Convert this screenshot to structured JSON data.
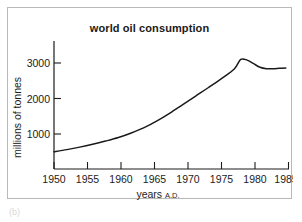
{
  "figure": {
    "caption_fragment": "(b)"
  },
  "chart_data": {
    "type": "line",
    "title": "world oil consumption",
    "xlabel": "years",
    "xlabel_suffix": "A.D.",
    "ylabel": "millions of tonnes",
    "xlim": [
      1950,
      1986.5
    ],
    "ylim": [
      0,
      3400
    ],
    "xticks": [
      1950,
      1955,
      1960,
      1965,
      1970,
      1975,
      1980,
      1985
    ],
    "xticklabels": [
      "1950",
      "1955",
      "1960",
      "1965",
      "1970",
      "1975",
      "1980",
      "1985"
    ],
    "yticks": [
      1000,
      2000,
      3000
    ],
    "yticklabels": [
      "1000",
      "2000",
      "3000"
    ],
    "grid": false,
    "legend": null,
    "line_color": "#1a1a1a",
    "series": [
      {
        "name": "world oil consumption",
        "x": [
          1950,
          1952,
          1954,
          1956,
          1958,
          1960,
          1962,
          1964,
          1966,
          1968,
          1970,
          1972,
          1974,
          1976,
          1978,
          1979,
          1980,
          1981,
          1982,
          1983,
          1984,
          1985,
          1986
        ],
        "values": [
          500,
          560,
          630,
          710,
          800,
          900,
          1030,
          1180,
          1370,
          1590,
          1830,
          2070,
          2310,
          2560,
          2830,
          3100,
          3080,
          2980,
          2880,
          2840,
          2840,
          2850,
          2860
        ]
      }
    ]
  }
}
